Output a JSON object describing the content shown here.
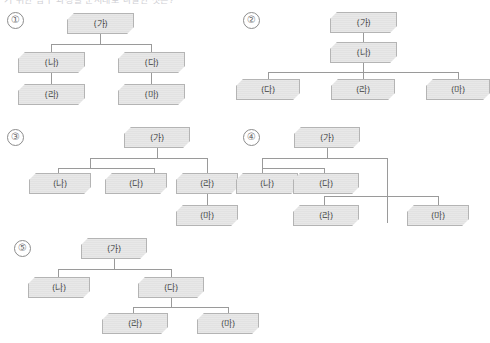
{
  "page": {
    "cutoff_text": "기 위한 탐구 과정을 순서대로 나열한 것은?",
    "background_color": "#ffffff",
    "node_fill": "#e2e2e2",
    "node_border": "#b4b4b4",
    "connector_color": "#9a9a9a",
    "label_color": "#3b3b3b"
  },
  "labels": {
    "ga": "(가)",
    "na": "(나)",
    "da": "(다)",
    "ra": "(라)",
    "ma": "(마)"
  },
  "options": [
    {
      "number": "①",
      "nodes": [
        {
          "id": "ga",
          "label": "(가)"
        },
        {
          "id": "na",
          "label": "(나)"
        },
        {
          "id": "da",
          "label": "(다)"
        },
        {
          "id": "ra",
          "label": "(라)"
        },
        {
          "id": "ma",
          "label": "(마)"
        }
      ],
      "edges": [
        [
          "ga",
          "na"
        ],
        [
          "ga",
          "da"
        ],
        [
          "na",
          "ra"
        ],
        [
          "da",
          "ma"
        ]
      ]
    },
    {
      "number": "②",
      "nodes": [
        {
          "id": "ga",
          "label": "(가)"
        },
        {
          "id": "na",
          "label": "(나)"
        },
        {
          "id": "da",
          "label": "(다)"
        },
        {
          "id": "ra",
          "label": "(라)"
        },
        {
          "id": "ma",
          "label": "(마)"
        }
      ],
      "edges": [
        [
          "ga",
          "na"
        ],
        [
          "na",
          "da"
        ],
        [
          "na",
          "ra"
        ],
        [
          "na",
          "ma"
        ]
      ]
    },
    {
      "number": "③",
      "nodes": [
        {
          "id": "ga",
          "label": "(가)"
        },
        {
          "id": "na",
          "label": "(나)"
        },
        {
          "id": "da",
          "label": "(다)"
        },
        {
          "id": "ra",
          "label": "(라)"
        },
        {
          "id": "ma",
          "label": "(마)"
        }
      ],
      "edges": [
        [
          "ga",
          "na"
        ],
        [
          "ga",
          "da"
        ],
        [
          "ga",
          "ra"
        ],
        [
          "ra",
          "ma"
        ]
      ]
    },
    {
      "number": "④",
      "nodes": [
        {
          "id": "ga",
          "label": "(가)"
        },
        {
          "id": "na",
          "label": "(나)"
        },
        {
          "id": "da",
          "label": "(다)"
        },
        {
          "id": "ra",
          "label": "(라)"
        },
        {
          "id": "ma",
          "label": "(마)"
        }
      ],
      "edges": [
        [
          "ga",
          "na"
        ],
        [
          "ga",
          "da"
        ],
        [
          "ga",
          "ra"
        ],
        [
          "ga",
          "ma"
        ]
      ]
    },
    {
      "number": "⑤",
      "nodes": [
        {
          "id": "ga",
          "label": "(가)"
        },
        {
          "id": "na",
          "label": "(나)"
        },
        {
          "id": "da",
          "label": "(다)"
        },
        {
          "id": "ra",
          "label": "(라)"
        },
        {
          "id": "ma",
          "label": "(마)"
        }
      ],
      "edges": [
        [
          "ga",
          "na"
        ],
        [
          "ga",
          "da"
        ],
        [
          "da",
          "ra"
        ],
        [
          "da",
          "ma"
        ]
      ]
    }
  ]
}
